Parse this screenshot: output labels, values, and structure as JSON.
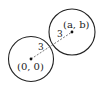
{
  "diagram": {
    "circles": [
      {
        "name": "circle-origin",
        "center_label": "(0, 0)",
        "radius_label": "3",
        "cx": 31,
        "cy": 59,
        "r": 22.5
      },
      {
        "name": "circle-ab",
        "center_label": "(a, b)",
        "radius_label": "3",
        "cx": 72,
        "cy": 32,
        "r": 23
      }
    ],
    "segment": {
      "style": "dashed",
      "from": "(0, 0)",
      "to": "(a, b)"
    },
    "colors": {
      "stroke": "#222222",
      "background": "#ffffff"
    }
  }
}
